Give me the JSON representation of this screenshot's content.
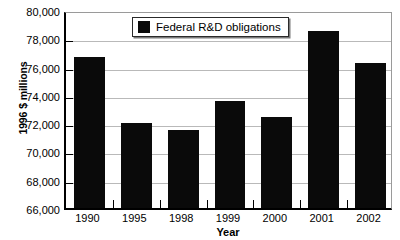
{
  "chart_data": {
    "type": "bar",
    "title": "",
    "xlabel": "Year",
    "ylabel": "1996 $ millions",
    "categories": [
      "1990",
      "1995",
      "1998",
      "1999",
      "2000",
      "2001",
      "2002"
    ],
    "values": [
      76700,
      72000,
      71500,
      73600,
      72450,
      78500,
      76250
    ],
    "series": [
      {
        "name": "Federal R&D obligations",
        "color": "#0a0a0a",
        "values": [
          76700,
          72000,
          71500,
          73600,
          72450,
          78500,
          76250
        ]
      }
    ],
    "ylim": [
      66000,
      80000
    ],
    "yticks": [
      66000,
      68000,
      70000,
      72000,
      74000,
      76000,
      78000,
      80000
    ],
    "ytick_labels": [
      "66,000",
      "68,000",
      "70,000",
      "72,000",
      "74,000",
      "76,000",
      "78,000",
      "80,000"
    ],
    "grid": true,
    "legend": {
      "position": "top-center",
      "entries": [
        {
          "label": "Federal R&D obligations",
          "color": "#0a0a0a",
          "swatch": "filled-square"
        }
      ]
    }
  }
}
